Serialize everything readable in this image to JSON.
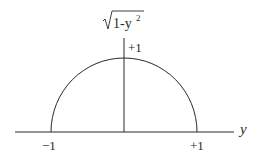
{
  "diagram": {
    "title_function": "√(1−y²)",
    "function_label": {
      "radical": "√",
      "radicand": "1-y",
      "exponent": "2"
    },
    "axis": {
      "horizontal_label": "y"
    },
    "ticks": {
      "left": "−1",
      "right": "+1",
      "top": "+1"
    },
    "curve": {
      "type": "semicircle",
      "description": "upper half of unit circle",
      "x_range": [
        -1,
        1
      ],
      "peak": 1
    },
    "colors": {
      "stroke": "#2a2a2a",
      "background": "#ffffff"
    }
  }
}
